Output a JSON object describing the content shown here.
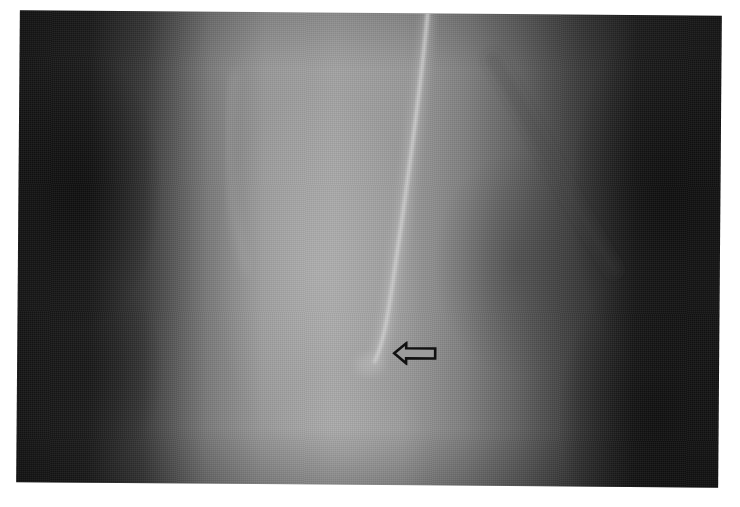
{
  "image": {
    "type": "radiograph",
    "modality": "grayscale X-ray",
    "background_color": "#ffffff",
    "tone_colors": {
      "dark_lung": "#161616",
      "mid_soft_tissue": "#7a7a7a",
      "bright_center": "#a3a3a3",
      "catheter": "#d4d4d4"
    }
  },
  "annotations": {
    "arrow": {
      "icon": "left-arrow-outline",
      "direction": "left",
      "stroke_color": "#111111",
      "fill_color": "#9c9c9c"
    },
    "catheter_line": {
      "description": "thin radiopaque line descending through center, tip near arrow"
    }
  }
}
